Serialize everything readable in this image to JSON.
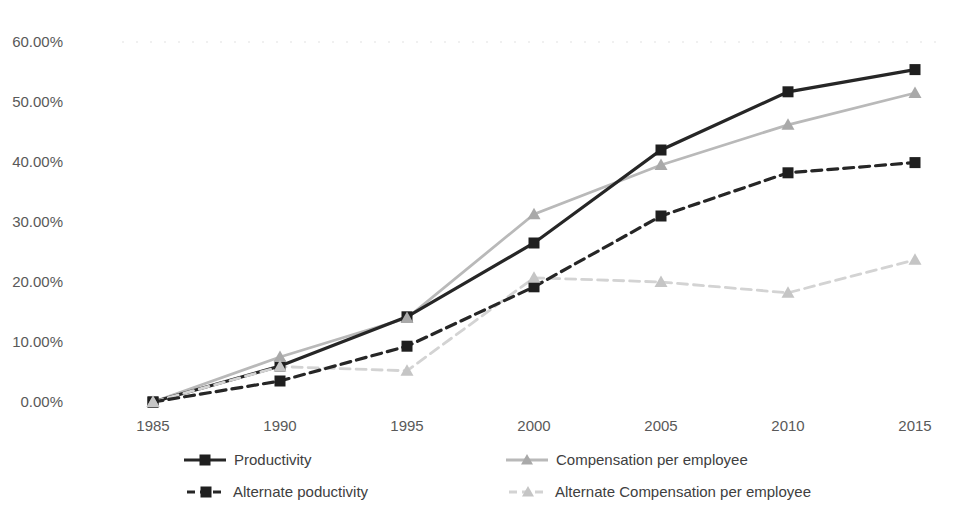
{
  "chart_data": {
    "type": "line",
    "title": "",
    "xlabel": "",
    "ylabel": "",
    "categories": [
      "1985",
      "1990",
      "1995",
      "2000",
      "2005",
      "2010",
      "2015"
    ],
    "series": [
      {
        "name": "Productivity",
        "values": [
          0.0,
          6.0,
          14.2,
          26.5,
          42.0,
          51.7,
          55.4
        ],
        "color": "#262626",
        "marker_color": "#1f1f1f",
        "dash": "solid",
        "marker": "square"
      },
      {
        "name": "Compensation per employee",
        "values": [
          0.0,
          7.5,
          14.0,
          31.3,
          39.5,
          46.2,
          51.5
        ],
        "color": "#b9b9b9",
        "marker_color": "#a9a9a9",
        "dash": "solid",
        "marker": "triangle"
      },
      {
        "name": "Alternate poductivity",
        "values": [
          0.0,
          3.5,
          9.3,
          19.2,
          31.0,
          38.2,
          39.9
        ],
        "color": "#262626",
        "marker_color": "#1f1f1f",
        "dash": "dashed",
        "marker": "square"
      },
      {
        "name": "Alternate Compensation per employee",
        "values": [
          0.0,
          5.9,
          5.2,
          20.7,
          20.0,
          18.2,
          23.7
        ],
        "color": "#d3d3d3",
        "marker_color": "#c5c5c5",
        "dash": "dashed",
        "marker": "triangle"
      }
    ],
    "y_ticks": [
      "0.00%",
      "10.00%",
      "20.00%",
      "30.00%",
      "40.00%",
      "50.00%",
      "60.00%"
    ],
    "y_tick_values": [
      0,
      10,
      20,
      30,
      40,
      50,
      60
    ],
    "ylim": [
      0,
      60
    ],
    "grid": "faint dotted line at 60% only",
    "legend_position": "bottom, two columns, two rows"
  },
  "colors": {
    "background": "#ffffff",
    "axis_text": "#595959",
    "legend_text": "#404040",
    "faint_gridline": "#ececec"
  }
}
